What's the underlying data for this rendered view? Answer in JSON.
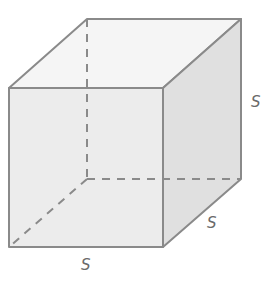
{
  "diagram": {
    "type": "cube",
    "edge_labels": {
      "height": "S",
      "depth": "S",
      "width": "S"
    },
    "colors": {
      "front_face": "#ececec",
      "top_face": "#f5f5f5",
      "right_face": "#e0e0e0",
      "edge": "#8a8a8a",
      "hidden_edge": "#8a8a8a",
      "label": "#6a6a6a"
    }
  }
}
